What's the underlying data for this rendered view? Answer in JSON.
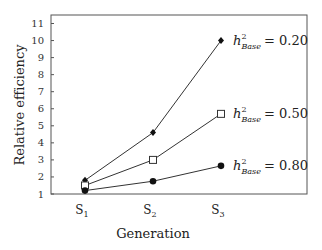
{
  "chart_data": {
    "type": "line",
    "title": "",
    "xlabel": "Generation",
    "ylabel": "Relative efficiency",
    "categories": [
      "S1",
      "S2",
      "S3"
    ],
    "category_subscripts": [
      "1",
      "2",
      "3"
    ],
    "ylim": [
      1,
      11
    ],
    "yticks": [
      1,
      2,
      3,
      4,
      5,
      6,
      7,
      8,
      9,
      10,
      11
    ],
    "grid": false,
    "legend_position": "inline-right",
    "series": [
      {
        "name": "h²_Base = 0.20",
        "h2": "0.20",
        "marker": "diamond",
        "values": [
          1.8,
          4.6,
          10.0
        ]
      },
      {
        "name": "h²_Base = 0.50",
        "h2": "0.50",
        "marker": "open-square",
        "values": [
          1.5,
          3.0,
          5.7
        ]
      },
      {
        "name": "h²_Base = 0.80",
        "h2": "0.80",
        "marker": "filled-circle",
        "values": [
          1.2,
          1.75,
          2.65
        ]
      }
    ]
  },
  "labels": {
    "h": "h",
    "sup": "2",
    "sub": "Base",
    "eq": "= "
  }
}
